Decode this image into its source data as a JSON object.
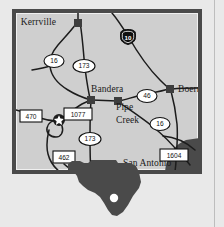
{
  "figure": {
    "kind": "locator-map",
    "colors": {
      "page_background": "#e9e9e9",
      "map_fill": "#cfcfcf",
      "map_border": "#4a4a4a",
      "road_line": "#1c1c1c",
      "city_marker": "#3d3d3d",
      "urban_area": "#4a4a4a",
      "inset_fill": "#4a4a4a",
      "shield_fill": "#ffffff",
      "interstate_fill": "#111111",
      "star_fill": "#ffffff",
      "label_color": "#1a1a1a",
      "page_rule": "#bdbdbd"
    }
  },
  "map": {
    "cities": [
      {
        "name": "Kerrville",
        "label_x": 56,
        "label_y": 25,
        "anchor": "end",
        "marker_x": 78,
        "marker_y": 23
      },
      {
        "name": "Bandera",
        "label_x": 91,
        "label_y": 92,
        "anchor": "start",
        "marker_x": 91,
        "marker_y": 100
      },
      {
        "name": "Boerne",
        "label_x": 178,
        "label_y": 92,
        "anchor": "start",
        "marker_x": 170,
        "marker_y": 89
      },
      {
        "name": "Pipe",
        "label_x": 116,
        "label_y": 110,
        "anchor": "start",
        "marker_x": 118,
        "marker_y": 101
      },
      {
        "name": "Creek",
        "label_x": 116,
        "label_y": 123,
        "anchor": "start",
        "marker_x": null,
        "marker_y": null
      },
      {
        "name": "San Antonio",
        "label_x": 123,
        "label_y": 166,
        "anchor": "start",
        "marker_x": null,
        "marker_y": null
      }
    ],
    "route_shields": [
      {
        "number": "16",
        "type": "state",
        "x": 54,
        "y": 61
      },
      {
        "number": "173",
        "type": "state",
        "x": 84,
        "y": 66
      },
      {
        "number": "10",
        "type": "interstate",
        "x": 128,
        "y": 36
      },
      {
        "number": "46",
        "type": "state",
        "x": 147,
        "y": 96
      },
      {
        "number": "16",
        "type": "state",
        "x": 160,
        "y": 124
      },
      {
        "number": "173",
        "type": "state",
        "x": 90,
        "y": 139
      },
      {
        "number": "470",
        "type": "fm",
        "x": 31,
        "y": 116
      },
      {
        "number": "1077",
        "type": "fm",
        "x": 78,
        "y": 114
      },
      {
        "number": "462",
        "type": "fm",
        "x": 64,
        "y": 157
      },
      {
        "number": "1604",
        "type": "fm",
        "x": 174,
        "y": 155
      }
    ],
    "star_marker": {
      "x": 59,
      "y": 120,
      "name": "point-of-interest-star"
    },
    "urban_area_name": "San Antonio urban area"
  },
  "inset": {
    "name": "Texas state outline",
    "location_dot": {
      "x": 114,
      "y": 198
    }
  }
}
